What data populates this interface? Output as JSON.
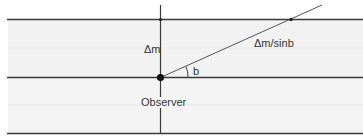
{
  "diagram": {
    "type": "geometry-diagram",
    "colors": {
      "band_fill": "#f1f1f1",
      "line": "#3a3a3a",
      "diagonal": "#555555",
      "dot": "#111111"
    },
    "labels": {
      "vertical_distance": "Δm",
      "slant_distance": "Δm/sinb",
      "angle": "b",
      "observer": "Observer"
    },
    "horizontal_lines": [
      {
        "name": "top-boundary",
        "y": 19
      },
      {
        "name": "observer-level",
        "y": 77
      },
      {
        "name": "bottom-boundary",
        "y": 133
      }
    ],
    "vertical_line": {
      "x": 160,
      "y_start": 0,
      "y_end": 133
    },
    "observer_point": {
      "x": 160,
      "y": 77
    },
    "diagonal": {
      "x1": 160,
      "y1": 77,
      "x2": 322,
      "y2": 5,
      "intersection": {
        "x": 291,
        "y": 19
      }
    }
  }
}
